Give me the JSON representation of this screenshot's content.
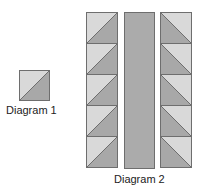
{
  "diagram1": {
    "label": "Diagram 1",
    "square": {
      "orientation": "bl-tr",
      "light": "upper-left",
      "dark": "lower-right"
    }
  },
  "diagram2": {
    "label": "Diagram 2",
    "left_column": {
      "squares": 5,
      "orientation": "bl-tr",
      "light": "upper-left",
      "dark": "lower-right"
    },
    "center_strip": {
      "fill": "solid"
    },
    "right_column": {
      "squares": 5,
      "orientation": "tl-br",
      "light": "upper-right",
      "dark": "lower-left"
    }
  },
  "colors": {
    "light": "#d9d9d9",
    "dark": "#a8a8a8",
    "strip": "#ababab",
    "border": "#6e6e6e",
    "text": "#222222"
  }
}
